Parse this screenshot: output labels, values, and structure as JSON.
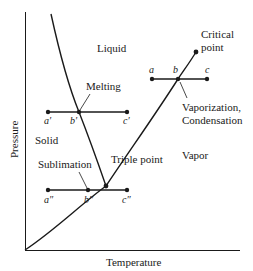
{
  "diagram": {
    "axes": {
      "x_label": "Temperature",
      "y_label": "Pressure"
    },
    "regions": {
      "liquid": "Liquid",
      "solid": "Solid",
      "vapor": "Vapor"
    },
    "annotations": {
      "critical_point_line1": "Critical",
      "critical_point_line2": "point",
      "melting": "Melting",
      "vaporization_line1": "Vaporization,",
      "vaporization_line2": "Condensation",
      "sublimation": "Sublimation",
      "triple_point": "Triple point"
    },
    "points": {
      "a": "a",
      "b": "b",
      "c": "c",
      "a_prime": "a′",
      "b_prime": "b′",
      "c_prime": "c′",
      "a_dprime": "a″",
      "b_dprime": "b″",
      "c_dprime": "c″"
    },
    "colors": {
      "line": "#1a1a1a",
      "background": "#ffffff"
    }
  }
}
